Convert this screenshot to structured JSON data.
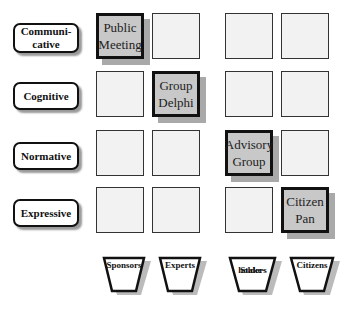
{
  "rows": [
    {
      "label": "Communi-\ncative",
      "label_lines": [
        "Communi-",
        "cative"
      ]
    },
    {
      "label": "Cognitive",
      "label_lines": [
        "Cognitive"
      ]
    },
    {
      "label": "Normative",
      "label_lines": [
        "Normative"
      ]
    },
    {
      "label": "Expressive",
      "label_lines": [
        "Expressive"
      ]
    }
  ],
  "columns": [
    {
      "label": "Sponsors",
      "label_lines": [
        "Sponsors"
      ]
    },
    {
      "label": "Experts",
      "label_lines": [
        "Experts"
      ]
    },
    {
      "label": "Stake-holders",
      "label_lines": [
        "Stake-",
        "holders"
      ]
    },
    {
      "label": "Citizens",
      "label_lines": [
        "Citizens"
      ]
    }
  ],
  "highlighted_cells": [
    {
      "row": 0,
      "col": 0,
      "lines": [
        "Public",
        "Meeting"
      ]
    },
    {
      "row": 1,
      "col": 1,
      "lines": [
        "Group",
        "Delphi"
      ]
    },
    {
      "row": 2,
      "col": 2,
      "lines": [
        "Advisory",
        "Group"
      ]
    },
    {
      "row": 3,
      "col": 3,
      "lines": [
        "Citizen",
        "Pan"
      ]
    }
  ],
  "colors": {
    "highlight_fill": "#c8c8c8",
    "cell_fill": "#f2f2f2",
    "border": "#111111",
    "shadow": "#a9a9a9"
  }
}
